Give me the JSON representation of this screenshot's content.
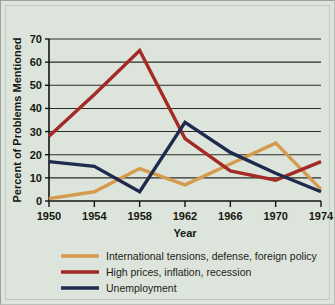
{
  "chart_data": {
    "type": "line",
    "title": "",
    "xlabel": "Year",
    "ylabel": "Percent of Problems Mentioned",
    "categories": [
      1950,
      1954,
      1958,
      1962,
      1966,
      1970,
      1974
    ],
    "x": [
      1950,
      1954,
      1958,
      1962,
      1966,
      1970,
      1974
    ],
    "xlim": [
      1950,
      1974
    ],
    "ylim": [
      0,
      70
    ],
    "yticks": [
      0,
      10,
      20,
      30,
      40,
      50,
      60,
      70
    ],
    "xticks": [
      "1950",
      "1954",
      "1958",
      "1962",
      "1966",
      "1970",
      "1974"
    ],
    "grid": "horizontal",
    "legend_position": "bottom",
    "series": [
      {
        "name": "International tensions, defense, foreign policy",
        "color": "#d49b4e",
        "values": [
          1,
          4,
          14,
          7,
          16,
          25,
          5
        ]
      },
      {
        "name": "High prices, inflation, recession",
        "color": "#a32a25",
        "values": [
          28,
          46,
          65,
          27,
          13,
          9,
          17
        ]
      },
      {
        "name": "Unemployment",
        "color": "#1e2b4d",
        "values": [
          17,
          15,
          4,
          34,
          21,
          12,
          4
        ]
      }
    ]
  },
  "legend": {
    "items": [
      {
        "label": "International tensions, defense, foreign policy",
        "color": "#d49b4e"
      },
      {
        "label": "High prices, inflation, recession",
        "color": "#a32a25"
      },
      {
        "label": "Unemployment",
        "color": "#1e2b4d"
      }
    ]
  },
  "axes": {
    "y_title": "Percent of Problems Mentioned",
    "x_title": "Year",
    "y_tick_labels": [
      "0",
      "10",
      "20",
      "30",
      "40",
      "50",
      "60",
      "70"
    ],
    "x_tick_labels": [
      "1950",
      "1954",
      "1958",
      "1962",
      "1966",
      "1970",
      "1974"
    ]
  },
  "colors": {
    "background": "#dde4dc",
    "border": "#9aa29a",
    "axis": "#12140f",
    "grid": "#2a2d26"
  }
}
